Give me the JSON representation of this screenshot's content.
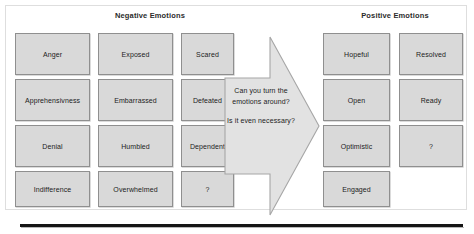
{
  "slide": {
    "negative": {
      "title": "Negative Emotions",
      "columns": [
        {
          "name": "negative-column-1",
          "items": [
            {
              "label": "Anger"
            },
            {
              "label": "Apprehensivness"
            },
            {
              "label": "Denial"
            },
            {
              "label": "Indifference"
            }
          ]
        },
        {
          "name": "negative-column-2",
          "items": [
            {
              "label": "Exposed"
            },
            {
              "label": "Embarrassed"
            },
            {
              "label": "Humbled"
            },
            {
              "label": "Overwhelmed"
            }
          ]
        },
        {
          "name": "negative-column-3",
          "items": [
            {
              "label": "Scared"
            },
            {
              "label": "Defeated"
            },
            {
              "label": "Dependent"
            },
            {
              "label": "?"
            }
          ]
        }
      ]
    },
    "arrow": {
      "question_1": "Can you turn the emotions around?",
      "question_2": "Is it even necessary?",
      "direction": "right"
    },
    "positive": {
      "title": "Positive Emotions",
      "columns": [
        {
          "name": "positive-column-1",
          "items": [
            {
              "label": "Hopeful"
            },
            {
              "label": "Open"
            },
            {
              "label": "Optimistic"
            },
            {
              "label": "Engaged"
            }
          ]
        },
        {
          "name": "positive-column-2",
          "items": [
            {
              "label": "Resolved"
            },
            {
              "label": "Ready"
            },
            {
              "label": "?"
            }
          ]
        }
      ]
    },
    "colors": {
      "box_fill": "#d9d9d9",
      "box_border": "#8f8f8f",
      "arrow_fill": "#e2e2e2",
      "arrow_border": "#a6a6a6",
      "rule": "#151515",
      "text": "#1c1c1c"
    }
  }
}
